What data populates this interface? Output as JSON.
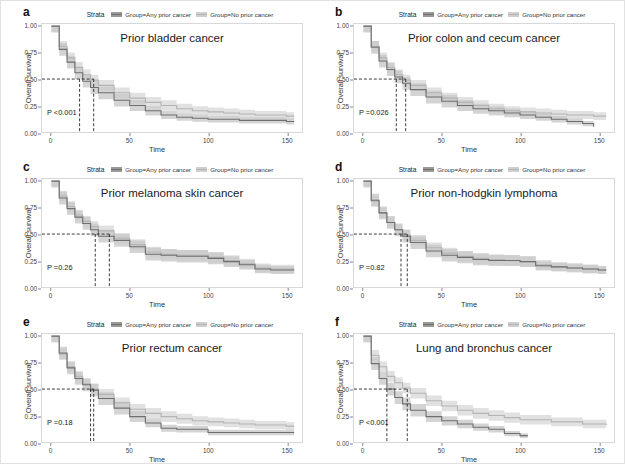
{
  "figure": {
    "legend_title": "Strata",
    "series_labels": [
      "Group=Any prior cancer",
      "Group=No prior cancer"
    ],
    "axis": {
      "ylabel": "Overall survival",
      "xlabel": "Time",
      "yticks": [
        "0.00",
        "0.25",
        "0.50",
        "0.75",
        "1.00"
      ],
      "ytick_values": [
        0.0,
        0.25,
        0.5,
        0.75,
        1.0
      ],
      "xticks": [
        "0",
        "50",
        "100",
        "150"
      ],
      "xtick_values": [
        0,
        50,
        100,
        150
      ],
      "xlim": [
        -6,
        160
      ],
      "ylim": [
        0,
        1.02
      ]
    },
    "colors": {
      "any_prior_line": "#6e6e6e",
      "any_prior_band": "#c9c9c9",
      "no_prior_line": "#b4b4b4",
      "no_prior_band": "#dcdcdc",
      "median_guide": "#222222",
      "panel_border": "#d8d8d8"
    },
    "panels": [
      {
        "letter": "a",
        "title": "Prior bladder cancer",
        "pvalue": "P <0.001",
        "median_any": 18,
        "median_no": 27
      },
      {
        "letter": "b",
        "title": "Prior colon and cecum cancer",
        "pvalue": "P =0.026",
        "median_any": 21,
        "median_no": 27
      },
      {
        "letter": "c",
        "title": "Prior melanoma skin cancer",
        "pvalue": "P =0.26",
        "median_any": 28,
        "median_no": 37
      },
      {
        "letter": "d",
        "title": "Prior non-hodgkin lymphoma",
        "pvalue": "P =0.82",
        "median_any": 24,
        "median_no": 28
      },
      {
        "letter": "e",
        "title": "Prior rectum cancer",
        "pvalue": "P =0.18",
        "median_any": 25,
        "median_no": 27
      },
      {
        "letter": "f",
        "title": "Lung and bronchus cancer",
        "pvalue": "P <0.001",
        "median_any": 15,
        "median_no": 28
      }
    ]
  },
  "chart_data": {
    "type": "line",
    "xlabel": "Time",
    "ylabel": "Overall survival",
    "xlim": [
      0,
      155
    ],
    "ylim": [
      0,
      1.0
    ],
    "grid": false,
    "legend_position": "top-center",
    "panels": [
      {
        "letter": "a",
        "title": "Prior bladder cancer",
        "pvalue": "P <0.001",
        "median_survival": {
          "Group=Any prior cancer": 18,
          "Group=No prior cancer": 27
        },
        "x": [
          0,
          5,
          10,
          15,
          20,
          25,
          30,
          40,
          50,
          60,
          70,
          80,
          90,
          100,
          110,
          120,
          130,
          140,
          150,
          155
        ],
        "series": [
          {
            "name": "Group=Any prior cancer",
            "values": [
              1.0,
              0.78,
              0.66,
              0.56,
              0.48,
              0.42,
              0.37,
              0.3,
              0.25,
              0.2,
              0.16,
              0.14,
              0.13,
              0.12,
              0.12,
              0.11,
              0.11,
              0.11,
              0.1,
              0.1
            ]
          },
          {
            "name": "Group=No prior cancer",
            "values": [
              1.0,
              0.81,
              0.7,
              0.61,
              0.54,
              0.49,
              0.44,
              0.37,
              0.32,
              0.28,
              0.25,
              0.22,
              0.2,
              0.19,
              0.18,
              0.17,
              0.16,
              0.16,
              0.15,
              0.15
            ]
          }
        ]
      },
      {
        "letter": "b",
        "title": "Prior colon and cecum cancer",
        "pvalue": "P =0.026",
        "median_survival": {
          "Group=Any prior cancer": 21,
          "Group=No prior cancer": 27
        },
        "x": [
          0,
          5,
          10,
          15,
          20,
          25,
          30,
          40,
          50,
          60,
          70,
          80,
          90,
          100,
          110,
          120,
          130,
          140,
          147,
          155
        ],
        "series": [
          {
            "name": "Group=Any prior cancer",
            "values": [
              1.0,
              0.8,
              0.67,
              0.59,
              0.52,
              0.46,
              0.4,
              0.33,
              0.29,
              0.25,
              0.22,
              0.2,
              0.18,
              0.16,
              0.14,
              0.12,
              0.1,
              0.08,
              0.05,
              null
            ]
          },
          {
            "name": "Group=No prior cancer",
            "values": [
              1.0,
              0.81,
              0.7,
              0.61,
              0.54,
              0.49,
              0.44,
              0.37,
              0.32,
              0.28,
              0.25,
              0.22,
              0.2,
              0.19,
              0.18,
              0.17,
              0.16,
              0.16,
              0.15,
              0.15
            ]
          }
        ]
      },
      {
        "letter": "c",
        "title": "Prior melanoma skin cancer",
        "pvalue": "P =0.26",
        "median_survival": {
          "Group=Any prior cancer": 28,
          "Group=No prior cancer": 37
        },
        "x": [
          0,
          5,
          10,
          15,
          20,
          25,
          30,
          40,
          50,
          60,
          70,
          80,
          90,
          100,
          110,
          120,
          130,
          140,
          150,
          155
        ],
        "series": [
          {
            "name": "Group=Any prior cancer",
            "values": [
              1.0,
              0.84,
              0.74,
              0.66,
              0.6,
              0.54,
              0.48,
              0.44,
              0.38,
              0.31,
              0.3,
              0.29,
              0.29,
              0.27,
              0.24,
              0.21,
              0.17,
              0.16,
              0.16,
              0.16
            ]
          },
          {
            "name": "Group=No prior cancer",
            "values": [
              1.0,
              0.86,
              0.76,
              0.68,
              0.62,
              0.57,
              0.53,
              0.46,
              0.4,
              0.33,
              0.31,
              0.3,
              0.3,
              0.28,
              0.25,
              0.22,
              0.18,
              0.17,
              0.17,
              0.17
            ]
          }
        ]
      },
      {
        "letter": "d",
        "title": "Prior non-hodgkin lymphoma",
        "pvalue": "P =0.82",
        "median_survival": {
          "Group=Any prior cancer": 24,
          "Group=No prior cancer": 28
        },
        "x": [
          0,
          5,
          10,
          15,
          20,
          25,
          30,
          40,
          50,
          60,
          70,
          80,
          90,
          100,
          110,
          120,
          130,
          140,
          150,
          155
        ],
        "series": [
          {
            "name": "Group=Any prior cancer",
            "values": [
              1.0,
              0.82,
              0.7,
              0.61,
              0.54,
              0.48,
              0.42,
              0.34,
              0.3,
              0.28,
              0.26,
              0.25,
              0.25,
              0.24,
              0.2,
              0.19,
              0.18,
              0.17,
              0.16,
              0.16
            ]
          },
          {
            "name": "Group=No prior cancer",
            "values": [
              1.0,
              0.81,
              0.7,
              0.61,
              0.54,
              0.49,
              0.44,
              0.37,
              0.32,
              0.29,
              0.27,
              0.26,
              0.25,
              0.24,
              0.21,
              0.19,
              0.18,
              0.17,
              0.16,
              0.16
            ]
          }
        ]
      },
      {
        "letter": "e",
        "title": "Prior rectum cancer",
        "pvalue": "P =0.18",
        "median_survival": {
          "Group=Any prior cancer": 25,
          "Group=No prior cancer": 27
        },
        "x": [
          0,
          5,
          10,
          15,
          20,
          25,
          30,
          40,
          50,
          60,
          70,
          80,
          90,
          100,
          110,
          120,
          130,
          140,
          150,
          155
        ],
        "series": [
          {
            "name": "Group=Any prior cancer",
            "values": [
              1.0,
              0.84,
              0.7,
              0.6,
              0.54,
              0.49,
              0.41,
              0.32,
              0.24,
              0.18,
              0.13,
              0.12,
              0.12,
              0.09,
              0.09,
              0.09,
              0.09,
              0.09,
              0.09,
              0.09
            ]
          },
          {
            "name": "Group=No prior cancer",
            "values": [
              1.0,
              0.83,
              0.71,
              0.62,
              0.55,
              0.5,
              0.45,
              0.37,
              0.31,
              0.27,
              0.24,
              0.22,
              0.2,
              0.19,
              0.18,
              0.17,
              0.16,
              0.16,
              0.15,
              0.15
            ]
          }
        ]
      },
      {
        "letter": "f",
        "title": "Lung and bronchus cancer",
        "pvalue": "P <0.001",
        "median_survival": {
          "Group=Any prior cancer": 15,
          "Group=No prior cancer": 28
        },
        "x": [
          0,
          5,
          10,
          15,
          20,
          25,
          30,
          40,
          50,
          60,
          70,
          80,
          90,
          100,
          105,
          120,
          140,
          155
        ],
        "series": [
          {
            "name": "Group=Any prior cancer",
            "values": [
              1.0,
              0.74,
              0.6,
              0.5,
              0.42,
              0.36,
              0.3,
              0.24,
              0.2,
              0.17,
              0.14,
              0.12,
              0.08,
              0.06,
              0.06,
              null,
              null,
              null
            ]
          },
          {
            "name": "Group=No prior cancer",
            "values": [
              1.0,
              0.82,
              0.71,
              0.62,
              0.56,
              0.51,
              0.46,
              0.39,
              0.34,
              0.3,
              0.27,
              0.25,
              0.23,
              0.21,
              0.21,
              0.19,
              0.17,
              0.16
            ]
          }
        ]
      }
    ]
  }
}
